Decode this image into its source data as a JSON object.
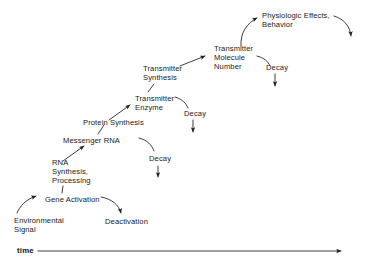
{
  "figure": {
    "type": "flow-diagram",
    "background": "#ffffff",
    "ink": "#1a1a1a",
    "axis": {
      "label": "time",
      "direction": "left-to-right",
      "arrow": "right"
    }
  },
  "nodes": [
    {
      "id": "environmental-signal",
      "text": "Environmental\nSignal",
      "x": 14,
      "y": 216
    },
    {
      "id": "gene-activation",
      "text": "Gene Activation",
      "x": 45,
      "y": 195
    },
    {
      "id": "deactivation",
      "text": "Deactivation",
      "x": 105,
      "y": 217
    },
    {
      "id": "rna-synthesis",
      "text": "RNA\nSynthesis,\nProcessing",
      "x": 52,
      "y": 158
    },
    {
      "id": "messenger-rna",
      "text": "Messenger RNA",
      "x": 63,
      "y": 136
    },
    {
      "id": "decay-mrna",
      "text": "Decay",
      "x": 149,
      "y": 154
    },
    {
      "id": "protein-synthesis",
      "text": "Protein Synthesis",
      "x": 83,
      "y": 118
    },
    {
      "id": "transmitter-enzyme",
      "text": "Transmitter\nEnzyme",
      "x": 135,
      "y": 94
    },
    {
      "id": "decay-enzyme",
      "text": "Decay",
      "x": 184,
      "y": 109
    },
    {
      "id": "transmitter-synthesis",
      "text": "Transmitter\nSynthesis",
      "x": 143,
      "y": 64
    },
    {
      "id": "transmitter-molecule-number",
      "text": "Transmitter\nMolecule\nNumber",
      "x": 214,
      "y": 44
    },
    {
      "id": "decay-transmitter",
      "text": "Decay",
      "x": 266,
      "y": 63
    },
    {
      "id": "physiologic-effects",
      "text": "Physiologic Effects,\nBehavior",
      "x": 262,
      "y": 11
    }
  ],
  "edges": [
    {
      "id": "signal-to-gene",
      "from": "environmental-signal",
      "to": "gene-activation",
      "style": "curve",
      "arrow": true
    },
    {
      "id": "gene-to-deactivation",
      "from": "gene-activation",
      "to": "deactivation",
      "style": "curve",
      "arrow": true
    },
    {
      "id": "gene-to-rna",
      "from": "gene-activation",
      "to": "rna-synthesis",
      "style": "tick",
      "arrow": false
    },
    {
      "id": "rna-to-mrna",
      "from": "rna-synthesis",
      "to": "messenger-rna",
      "style": "line",
      "arrow": true
    },
    {
      "id": "mrna-to-decay",
      "from": "messenger-rna",
      "to": "decay-mrna",
      "style": "curve",
      "arrow": false
    },
    {
      "id": "decay-mrna-down",
      "from": "decay-mrna",
      "to": "",
      "style": "line",
      "arrow": true
    },
    {
      "id": "mrna-to-protein",
      "from": "messenger-rna",
      "to": "protein-synthesis",
      "style": "tick",
      "arrow": false
    },
    {
      "id": "protein-to-enzyme",
      "from": "protein-synthesis",
      "to": "transmitter-enzyme",
      "style": "line",
      "arrow": true
    },
    {
      "id": "enzyme-to-decay",
      "from": "transmitter-enzyme",
      "to": "decay-enzyme",
      "style": "curve",
      "arrow": false
    },
    {
      "id": "decay-enzyme-down",
      "from": "decay-enzyme",
      "to": "",
      "style": "line",
      "arrow": true
    },
    {
      "id": "enzyme-to-synthesis",
      "from": "transmitter-enzyme",
      "to": "transmitter-synthesis",
      "style": "tick",
      "arrow": false
    },
    {
      "id": "synthesis-to-molecule",
      "from": "transmitter-synthesis",
      "to": "transmitter-molecule-number",
      "style": "line",
      "arrow": true
    },
    {
      "id": "molecule-to-decay",
      "from": "transmitter-molecule-number",
      "to": "decay-transmitter",
      "style": "curve",
      "arrow": false
    },
    {
      "id": "decay-transmitter-down",
      "from": "decay-transmitter",
      "to": "",
      "style": "line",
      "arrow": true
    },
    {
      "id": "molecule-to-effects",
      "from": "transmitter-molecule-number",
      "to": "physiologic-effects",
      "style": "curve",
      "arrow": true
    },
    {
      "id": "effects-decay",
      "from": "physiologic-effects",
      "to": "",
      "style": "curve",
      "arrow": true
    }
  ]
}
